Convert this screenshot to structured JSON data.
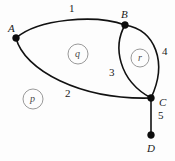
{
  "figure": {
    "background_color": "#fdfdfd",
    "stroke_color": "#111111",
    "face_circle_color": "#8d8d8d",
    "width": 175,
    "height": 161
  },
  "vertices": [
    {
      "id": "A",
      "label": "A",
      "x": 16,
      "y": 38,
      "label_x": 8,
      "label_y": 23
    },
    {
      "id": "B",
      "label": "B",
      "x": 125,
      "y": 25,
      "label_x": 121,
      "label_y": 9
    },
    {
      "id": "C",
      "label": "C",
      "x": 151,
      "y": 98,
      "label_x": 159,
      "label_y": 97
    },
    {
      "id": "D",
      "label": "D",
      "x": 151,
      "y": 135,
      "label_x": 147,
      "label_y": 143
    }
  ],
  "edges": [
    {
      "id": "e1",
      "label": "1",
      "from": "A",
      "to": "B",
      "label_x": 69,
      "label_y": 3
    },
    {
      "id": "e2",
      "label": "2",
      "from": "A",
      "to": "C",
      "label_x": 65,
      "label_y": 88
    },
    {
      "id": "e3",
      "label": "3",
      "from": "B",
      "to": "C",
      "label_x": 109,
      "label_y": 67
    },
    {
      "id": "e4",
      "label": "4",
      "from": "B",
      "to": "C",
      "label_x": 162,
      "label_y": 46
    },
    {
      "id": "e5",
      "label": "5",
      "from": "C",
      "to": "D",
      "label_x": 158,
      "label_y": 110
    }
  ],
  "faces": [
    {
      "id": "p",
      "label": "p",
      "cx": 33,
      "cy": 99,
      "r": 10
    },
    {
      "id": "q",
      "label": "q",
      "cx": 78,
      "cy": 54,
      "r": 10
    },
    {
      "id": "r",
      "label": "r",
      "cx": 140,
      "cy": 58,
      "r": 9
    }
  ]
}
